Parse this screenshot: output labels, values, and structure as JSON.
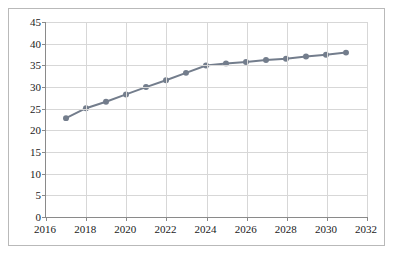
{
  "chart_data": {
    "type": "line",
    "title": "",
    "subtitle": "",
    "xlabel": "",
    "ylabel": "",
    "x": [
      2017,
      2018,
      2019,
      2020,
      2021,
      2022,
      2023,
      2024,
      2025,
      2026,
      2027,
      2028,
      2029,
      2030,
      2031
    ],
    "series": [
      {
        "name": "",
        "values": [
          22.7,
          25.0,
          26.5,
          28.2,
          29.9,
          31.5,
          33.2,
          34.9,
          35.4,
          35.7,
          36.2,
          36.5,
          37.0,
          37.4,
          37.9
        ]
      }
    ],
    "xlim": [
      2016,
      2032
    ],
    "ylim": [
      0,
      45
    ],
    "xticks": [
      2016,
      2018,
      2020,
      2022,
      2024,
      2026,
      2028,
      2030,
      2032
    ],
    "yticks": [
      0,
      5,
      10,
      15,
      20,
      25,
      30,
      35,
      40,
      45
    ],
    "xtick_labels": [
      "2016",
      "2018",
      "2020",
      "2022",
      "2024",
      "2026",
      "2028",
      "2030",
      "2032"
    ],
    "ytick_labels": [
      "0",
      "5",
      "10",
      "15",
      "20",
      "25",
      "30",
      "35",
      "40",
      "45"
    ],
    "grid": {
      "horizontal": true,
      "vertical": true,
      "color": "#d7d7d7"
    },
    "legend": {
      "visible": false,
      "position": "none",
      "entries": []
    },
    "style": {
      "line_color": "#737d8c",
      "marker_color": "#737d8c",
      "marker": "circle",
      "line_width": 2,
      "marker_size": 4,
      "background": "#ffffff",
      "axis_color": "#8a8a8a",
      "frame_color": "#b9b9b9",
      "text_color": "#1a1a1a"
    },
    "annotations": []
  }
}
